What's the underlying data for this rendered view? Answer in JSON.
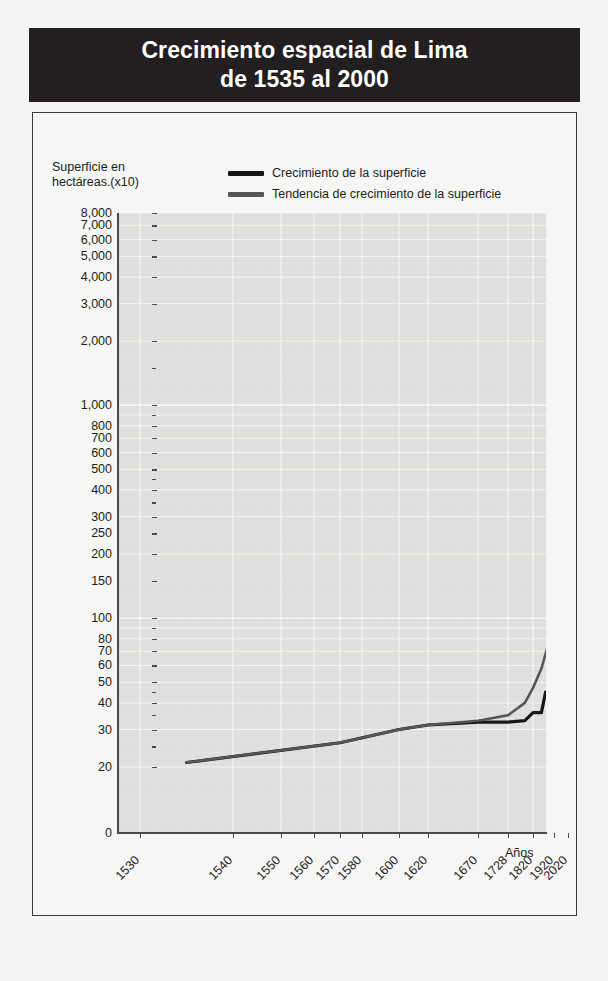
{
  "figure": {
    "title_lines": [
      "Crecimiento espacial de Lima",
      "de 1535 al 2000"
    ],
    "banner_color": "#231f20",
    "banner_text_color": "#ffffff",
    "plot_background": "#dededc",
    "page_background": "#f4f4f2"
  },
  "chart_data": {
    "type": "line",
    "title": "Crecimiento espacial de Lima de 1535 al 2000",
    "subtitle": "",
    "xlabel": "Años",
    "ylabel": "Superficie en hectáreas.(x10)",
    "yscale": "log",
    "grid": true,
    "legend_position": "top-center",
    "ylim": [
      20,
      8000
    ],
    "xlim": [
      1530,
      2020
    ],
    "ytick_labels": [
      "8,000",
      "7,000",
      "6,000",
      "5,000",
      "4,000",
      "3,000",
      "2,000",
      "1,000",
      "800",
      "700",
      "600",
      "500",
      "400",
      "300",
      "250",
      "200",
      "150",
      "100",
      "80",
      "70",
      "60",
      "50",
      "40",
      "30",
      "20",
      "0"
    ],
    "ytick_values": [
      8000,
      7000,
      6000,
      5000,
      4000,
      3000,
      2000,
      1000,
      800,
      700,
      600,
      500,
      400,
      300,
      250,
      200,
      150,
      100,
      80,
      70,
      60,
      50,
      40,
      30,
      20,
      0
    ],
    "xtick_labels": [
      "1530",
      "1540",
      "1550",
      "1560",
      "1570",
      "1580",
      "1600",
      "1620",
      "1670",
      "1728",
      "1820",
      "1920",
      "2020"
    ],
    "xtick_values": [
      1530,
      1540,
      1550,
      1560,
      1570,
      1580,
      1600,
      1620,
      1670,
      1728,
      1820,
      1920,
      2020
    ],
    "series": [
      {
        "name": "Crecimiento de la superficie",
        "color": "#17171a",
        "x": [
          1535,
          1570,
          1600,
          1620,
          1670,
          1728,
          1790,
          1820,
          1860,
          1880,
          1920,
          1940,
          1990
        ],
        "values": [
          21,
          26,
          30,
          31.5,
          32.5,
          32.5,
          33,
          36,
          36,
          45,
          46,
          100,
          8000
        ]
      },
      {
        "name": "Tendencia de crecimiento de la superficie",
        "color": "#565659",
        "x": [
          1535,
          1570,
          1600,
          1620,
          1670,
          1728,
          1790,
          1820,
          1860,
          1900,
          1920,
          1950,
          1990
        ],
        "values": [
          21,
          26,
          30,
          31.5,
          33,
          35,
          40,
          47,
          58,
          80,
          100,
          400,
          8000
        ]
      }
    ]
  },
  "legend": {
    "items": [
      {
        "label": "Crecimiento de la superficie",
        "color": "#17171a"
      },
      {
        "label": "Tendencia de crecimiento de la superficie",
        "color": "#565659"
      }
    ]
  },
  "axes": {
    "y_caption": "Superficie en\nhectáreas.(x10)",
    "x_caption": "Años"
  }
}
